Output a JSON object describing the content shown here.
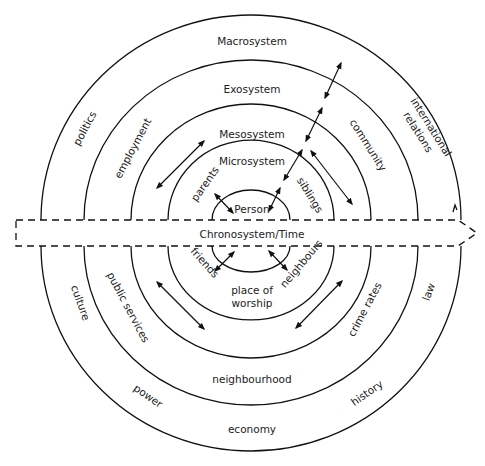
{
  "diagram": {
    "type": "concentric-rings",
    "system_labels": {
      "macrosystem": "Macrosystem",
      "exosystem": "Exosystem",
      "mesosystem": "Mesosystem",
      "microsystem": "Microsystem",
      "person": "Person",
      "chronosystem": "Chronosystem/Time"
    },
    "factors": {
      "politics": "politics",
      "employment": "employment",
      "parents": "parents",
      "siblings": "siblings",
      "community": "community",
      "international_1": "international",
      "international_2": "relations",
      "friends": "friends",
      "place_1": "place of",
      "place_2": "worship",
      "neighbours": "neighbours",
      "culture": "culture",
      "public_services": "public services",
      "crime_rates": "crime rates",
      "law": "law",
      "neighbourhood": "neighbourhood",
      "power": "power",
      "history": "history",
      "economy": "economy"
    },
    "colors": {
      "stroke": "#111111",
      "text": "#222222",
      "background": "#ffffff"
    }
  }
}
